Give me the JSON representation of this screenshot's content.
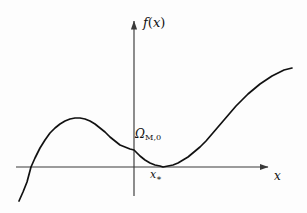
{
  "figure": {
    "background_color": "#fdfdfd",
    "ink_color": "#111111",
    "axis_color": "#3a3a3a"
  },
  "labels": {
    "y_axis": {
      "function_name": "f",
      "open_paren": "(",
      "variable": "x",
      "close_paren": ")"
    },
    "x_axis": {
      "variable": "x"
    },
    "y_intercept": {
      "symbol": "Ω",
      "subscript": "M,0"
    },
    "tangency_point": {
      "variable": "x",
      "subscript": "∗"
    }
  },
  "chart_data": {
    "type": "line",
    "title": "",
    "xlabel": "x",
    "ylabel": "f(x)",
    "grid": false,
    "legend": false,
    "axes": {
      "x_axis_pixel_y": 167,
      "y_axis_pixel_x": 134,
      "x_axis_start_px": 16,
      "x_axis_end_px": 272,
      "y_axis_top_px": 16,
      "y_axis_bottom_px": 196,
      "arrowheads": [
        "x-positive",
        "y-positive"
      ]
    },
    "annotations": [
      {
        "name": "y-intercept-label",
        "text": "Ω_M,0",
        "meaning": "value of f at x = 0",
        "at_px": [
          135,
          134
        ]
      },
      {
        "name": "tangency-label",
        "text": "x_∗",
        "meaning": "x value where curve touches the axis",
        "at_px": [
          152,
          174
        ]
      }
    ],
    "features": {
      "left_root_px_x": 31,
      "local_maximum_px": [
        78,
        118
      ],
      "y_intercept_px": [
        134,
        150
      ],
      "double_root_tangency_px": [
        163,
        167
      ],
      "curve_start_px": [
        19,
        201
      ],
      "curve_end_px": [
        292,
        68
      ]
    },
    "series": [
      {
        "name": "f(x)",
        "color": "#111111",
        "points_px": [
          [
            19,
            201
          ],
          [
            23,
            192
          ],
          [
            27,
            182
          ],
          [
            31,
            167
          ],
          [
            35,
            158
          ],
          [
            40,
            148
          ],
          [
            45,
            140
          ],
          [
            50,
            133
          ],
          [
            55,
            128
          ],
          [
            60,
            124
          ],
          [
            65,
            121
          ],
          [
            70,
            119
          ],
          [
            75,
            118
          ],
          [
            80,
            118
          ],
          [
            85,
            119
          ],
          [
            90,
            121
          ],
          [
            95,
            124
          ],
          [
            100,
            128
          ],
          [
            105,
            132
          ],
          [
            110,
            137
          ],
          [
            115,
            141
          ],
          [
            120,
            145
          ],
          [
            125,
            147
          ],
          [
            130,
            149
          ],
          [
            134,
            150
          ],
          [
            140,
            156
          ],
          [
            145,
            160
          ],
          [
            150,
            163
          ],
          [
            155,
            165
          ],
          [
            160,
            166
          ],
          [
            163,
            167
          ],
          [
            168,
            166
          ],
          [
            173,
            165
          ],
          [
            178,
            163
          ],
          [
            183,
            160
          ],
          [
            188,
            157
          ],
          [
            194,
            152
          ],
          [
            200,
            147
          ],
          [
            206,
            141
          ],
          [
            212,
            134
          ],
          [
            218,
            127
          ],
          [
            224,
            120
          ],
          [
            230,
            113
          ],
          [
            236,
            106
          ],
          [
            242,
            100
          ],
          [
            248,
            94
          ],
          [
            254,
            89
          ],
          [
            260,
            84
          ],
          [
            266,
            80
          ],
          [
            272,
            76
          ],
          [
            278,
            73
          ],
          [
            284,
            70
          ],
          [
            292,
            68
          ]
        ]
      }
    ]
  }
}
